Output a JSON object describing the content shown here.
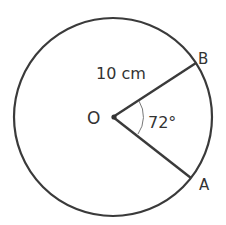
{
  "diagram": {
    "center_label": "O",
    "point_b_label": "B",
    "point_a_label": "A",
    "radius_label": "10 cm",
    "angle_label": "72°",
    "radius_cm": 10,
    "angle_deg": 72,
    "stroke_color": "#3a3a3a",
    "arc_color": "#777777"
  }
}
